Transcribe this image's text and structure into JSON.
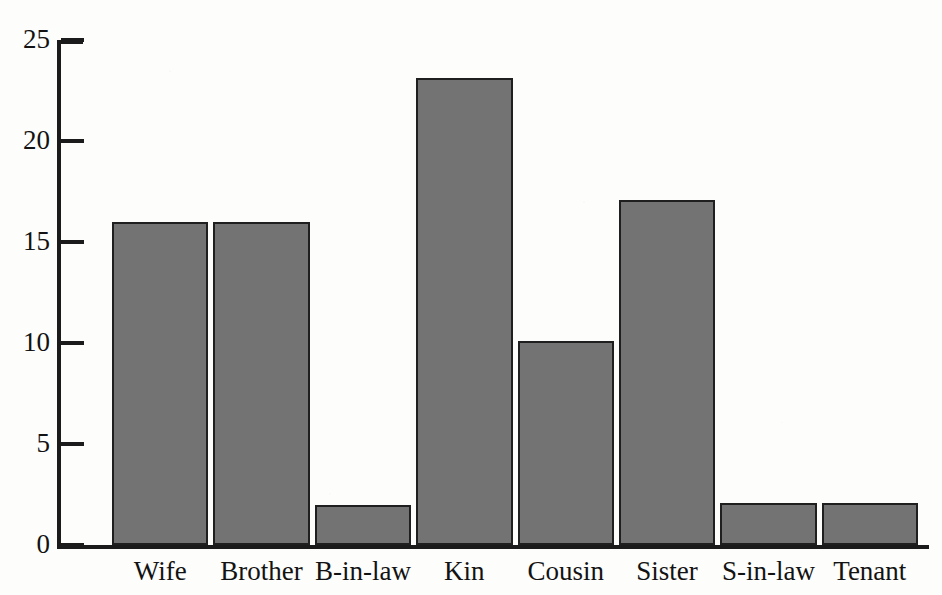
{
  "figure": {
    "background_color": "#fdfdfc",
    "bar_fill_color": "#737373",
    "bar_edge_color": "#1f1f1f",
    "axis_color": "#1b1b1b",
    "text_color": "#131313",
    "top_bleed_text": "___  ____ __  ___ ____ _____ __ ___"
  },
  "chart_data": {
    "type": "bar",
    "title": "",
    "subtitle": "",
    "xlabel": "",
    "ylabel": "",
    "categories": [
      "Wife",
      "Brother",
      "B-in-law",
      "Kin",
      "Cousin",
      "Sister",
      "S-in-law",
      "Tenant"
    ],
    "values": [
      16,
      16,
      2,
      23.1,
      10.1,
      17.1,
      2.1,
      2.1
    ],
    "series": [
      {
        "name": "Count",
        "values": [
          16,
          16,
          2,
          23.1,
          10.1,
          17.1,
          2.1,
          2.1
        ]
      }
    ],
    "ylim": [
      0,
      25
    ],
    "yticks": [
      0,
      5,
      10,
      15,
      20,
      25
    ],
    "ytick_labels": [
      "0",
      "5",
      "10",
      "15",
      "20",
      "25"
    ],
    "grid": false,
    "legend": null,
    "legend_position": "none",
    "annotations": []
  }
}
